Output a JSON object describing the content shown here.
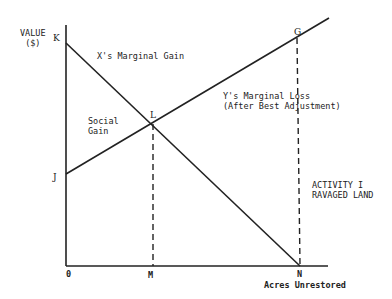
{
  "axes": {
    "y_label_line1": "VALUE",
    "y_label_line2": "($)",
    "x_label": "Acres Unrestored",
    "origin": "0"
  },
  "points": {
    "K": "K",
    "J": "J",
    "L": "L",
    "G": "G",
    "M": "M",
    "N": "N"
  },
  "labels": {
    "x_gain": "X's Marginal Gain",
    "y_loss_line1": "Y's Marginal Loss",
    "y_loss_line2": "(After Best Adjustment)",
    "social_gain_line1": "Social",
    "social_gain_line2": "Gain",
    "activity_line1": "ACTIVITY I",
    "activity_line2": "RAVAGED LAND"
  }
}
